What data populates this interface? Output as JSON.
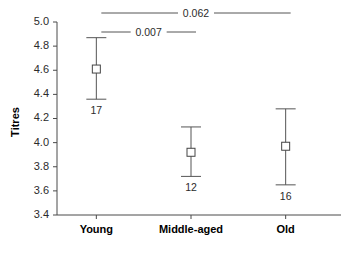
{
  "chart_data": {
    "type": "scatter",
    "title": "",
    "xlabel": "",
    "ylabel": "Titres",
    "categories": [
      "Young",
      "Middle-aged",
      "Old"
    ],
    "ylim": [
      3.4,
      5.0
    ],
    "yticks": [
      "3.4",
      "3.6",
      "3.8",
      "4.0",
      "4.2",
      "4.4",
      "4.6",
      "4.8",
      "5.0"
    ],
    "ytick_values": [
      3.4,
      3.6,
      3.8,
      4.0,
      4.2,
      4.4,
      4.6,
      4.8,
      5.0
    ],
    "grid": false,
    "legend": "none",
    "marker_style": "open-square",
    "error_bar_style": "capped-whisker",
    "series": [
      {
        "name": "Titres",
        "points": [
          {
            "category": "Young",
            "value": 4.61,
            "low": 4.36,
            "high": 4.87,
            "n_label": "17"
          },
          {
            "category": "Middle-aged",
            "value": 3.92,
            "low": 3.72,
            "high": 4.13,
            "n_label": "12"
          },
          {
            "category": "Old",
            "value": 3.97,
            "low": 3.65,
            "high": 4.28,
            "n_label": "16"
          }
        ]
      }
    ],
    "annotations": [
      {
        "label": "0.062",
        "from": "Young",
        "to": "Old",
        "level": 1
      },
      {
        "label": "0.007",
        "from": "Young",
        "to": "Middle-aged",
        "level": 2
      }
    ]
  }
}
